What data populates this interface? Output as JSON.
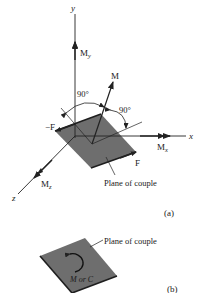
{
  "figure_a": {
    "axes": {
      "x": "x",
      "y": "y",
      "z": "z"
    },
    "moments": {
      "My": "M",
      "My_sub": "y",
      "Mx": "M",
      "Mx_sub": "x",
      "Mz": "M",
      "Mz_sub": "z",
      "M": "M"
    },
    "forces": {
      "neg_F": "−F",
      "F": "F"
    },
    "angles": [
      "90°",
      "90°"
    ],
    "plane_label": "Plane of couple",
    "caption": "(a)"
  },
  "figure_b": {
    "plane_label": "Plane of couple",
    "moment_label": "M or C",
    "caption": "(b)"
  },
  "colors": {
    "plate": "#6e6e6e",
    "plate_edge": "#1e1e1e",
    "line": "#222222"
  }
}
